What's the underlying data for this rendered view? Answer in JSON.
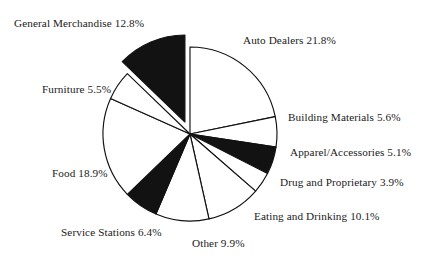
{
  "chart_data": {
    "type": "pie",
    "title": "",
    "subtitle": "",
    "xlabel": "",
    "ylabel": "",
    "legend": "none",
    "grid": false,
    "units": "percent",
    "start_angle_deg": 0,
    "direction": "clockwise",
    "categories": [
      "Auto Dealers",
      "Building Materials",
      "Apparel/Accessories",
      "Drug and Proprietary",
      "Eating and Drinking",
      "Other",
      "Service Stations",
      "Food",
      "Furniture",
      "General Merchandise"
    ],
    "values": [
      21.8,
      5.6,
      5.1,
      3.9,
      10.1,
      9.9,
      6.4,
      18.9,
      5.5,
      12.8
    ],
    "slices": [
      {
        "label": "Auto Dealers 21.8%",
        "name": "Auto Dealers",
        "value": 21.8,
        "fill": "#ffffff",
        "exploded": false,
        "label_x": 243,
        "label_y": 35
      },
      {
        "label": "Building Materials 5.6%",
        "name": "Building Materials",
        "value": 5.6,
        "fill": "#ffffff",
        "exploded": false,
        "label_x": 288,
        "label_y": 112
      },
      {
        "label": "Apparel/Accessories 5.1%",
        "name": "Apparel/Accessories",
        "value": 5.1,
        "fill": "#121212",
        "exploded": false,
        "label_x": 290,
        "label_y": 147
      },
      {
        "label": "Drug and Proprietary 3.9%",
        "name": "Drug and Proprietary",
        "value": 3.9,
        "fill": "#ffffff",
        "exploded": false,
        "label_x": 280,
        "label_y": 177
      },
      {
        "label": "Eating and Drinking 10.1%",
        "name": "Eating and Drinking",
        "value": 10.1,
        "fill": "#ffffff",
        "exploded": false,
        "label_x": 254,
        "label_y": 211
      },
      {
        "label": "Other 9.9%",
        "name": "Other",
        "value": 9.9,
        "fill": "#ffffff",
        "exploded": false,
        "label_x": 192,
        "label_y": 238
      },
      {
        "label": "Service Stations 6.4%",
        "name": "Service Stations",
        "value": 6.4,
        "fill": "#121212",
        "exploded": false,
        "label_x": 61,
        "label_y": 227
      },
      {
        "label": "Food 18.9%",
        "name": "Food",
        "value": 18.9,
        "fill": "#ffffff",
        "exploded": false,
        "label_x": 52,
        "label_y": 168
      },
      {
        "label": "Furniture 5.5%",
        "name": "Furniture",
        "value": 5.5,
        "fill": "#ffffff",
        "exploded": false,
        "label_x": 42,
        "label_y": 84
      },
      {
        "label": "General Merchandise 12.8%",
        "name": "General Merchandise",
        "value": 12.8,
        "fill": "#121212",
        "exploded": true,
        "label_x": 14,
        "label_y": 18
      }
    ],
    "geometry": {
      "center_x": 190,
      "center_y": 134,
      "radius": 87,
      "explode_offset": 13
    },
    "colors": {
      "filled": "#121212",
      "unfilled": "#ffffff",
      "outline": "#121212",
      "text": "#1a1a1a",
      "background": "#ffffff"
    }
  }
}
